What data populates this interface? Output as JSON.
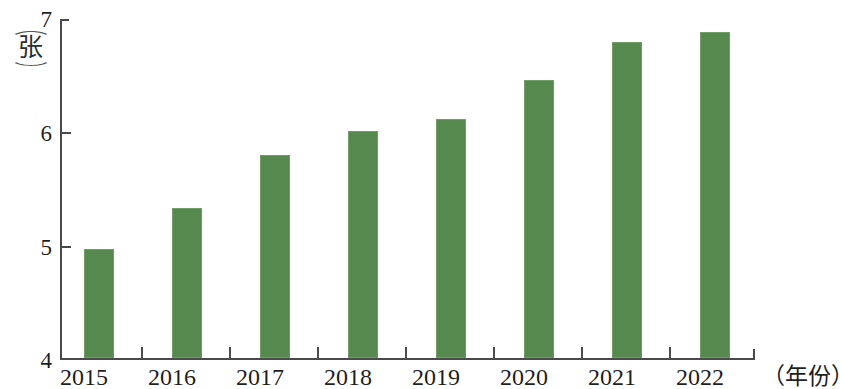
{
  "chart_data": {
    "type": "bar",
    "title": "",
    "subtitle": "",
    "xlabel": "（年份）",
    "ylabel": "（张）",
    "y_unit_paren_open": "︵",
    "y_unit_char": "张",
    "y_unit_paren_close": "︶",
    "categories": [
      "2015",
      "2016",
      "2017",
      "2018",
      "2019",
      "2020",
      "2021",
      "2022"
    ],
    "values": [
      4.96,
      5.32,
      5.79,
      6.0,
      6.1,
      6.45,
      6.78,
      6.87
    ],
    "series": [
      {
        "name": "",
        "values": [
          4.96,
          5.32,
          5.79,
          6.0,
          6.1,
          6.45,
          6.78,
          6.87
        ]
      }
    ],
    "ylim": [
      4,
      7
    ],
    "yticks": [
      4,
      5,
      6,
      7
    ],
    "ytick_labels": [
      "4",
      "5",
      "6",
      "7"
    ],
    "xtick_labels": [
      "2015",
      "2016",
      "2017",
      "2018",
      "2019",
      "2020",
      "2021",
      "2022"
    ],
    "grid": false,
    "legend": false,
    "legend_position": "none",
    "bar_color": "#55894d",
    "bar_edge_color": "#6f9e66",
    "axis_color": "#4a4a4a",
    "background_color": "#ffffff",
    "annotations": []
  }
}
